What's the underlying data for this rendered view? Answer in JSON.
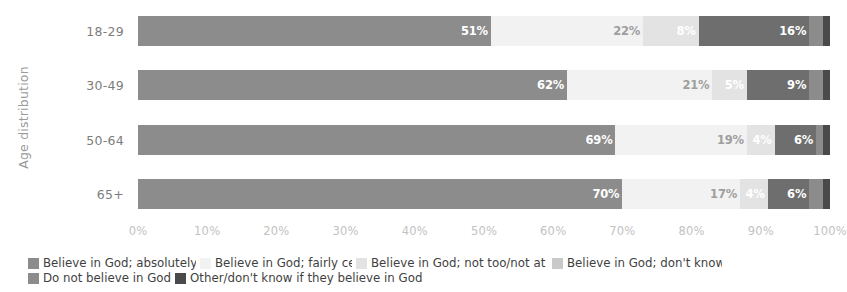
{
  "chart_data": {
    "type": "bar",
    "subtype": "stacked-horizontal-100",
    "title": "",
    "xlabel": "",
    "ylabel": "Age distribution",
    "categories": [
      "18-29",
      "30-49",
      "50-64",
      "65+"
    ],
    "xlim": [
      0,
      100
    ],
    "xticks": [
      "0%",
      "10%",
      "20%",
      "30%",
      "40%",
      "50%",
      "60%",
      "70%",
      "80%",
      "90%",
      "100%"
    ],
    "xtick_values": [
      0,
      10,
      20,
      30,
      40,
      50,
      60,
      70,
      80,
      90,
      100
    ],
    "grid": false,
    "legend_position": "bottom",
    "series": [
      {
        "name": "Believe in God; absolutely certain",
        "color": "#8c8c8c",
        "values": [
          51,
          62,
          69,
          70
        ],
        "labels": [
          "51%",
          "62%",
          "69%",
          "70%"
        ],
        "label_color": "light"
      },
      {
        "name": "Believe in God; fairly certain",
        "color": "#f2f2f2",
        "values": [
          22,
          21,
          19,
          17
        ],
        "labels": [
          "22%",
          "21%",
          "19%",
          "17%"
        ],
        "label_color": "dark"
      },
      {
        "name": "Believe in God; not too/not at all certain",
        "color": "#e3e3e3",
        "values": [
          8,
          5,
          4,
          4
        ],
        "labels": [
          "8%",
          "5%",
          "4%",
          "4%"
        ],
        "label_color": "light"
      },
      {
        "name": "Believe in God; don't know",
        "color": "#6e6e6e",
        "values": [
          16,
          9,
          6,
          6
        ],
        "labels": [
          "16%",
          "9%",
          "6%",
          "6%"
        ],
        "label_color": "light"
      },
      {
        "name": "Do not believe in God",
        "color": "#8c8c8c",
        "values": [
          2,
          2,
          1,
          2
        ],
        "labels": [
          "",
          "",
          "",
          ""
        ],
        "label_color": "light"
      },
      {
        "name": "Other/don't know if they believe in God",
        "color": "#4a4a4a",
        "values": [
          1,
          1,
          1,
          1
        ],
        "labels": [
          "",
          "",
          "",
          ""
        ],
        "label_color": "light"
      }
    ]
  },
  "legend": {
    "items": [
      {
        "label": "Believe in God; absolutely certain",
        "color": "#8c8c8c"
      },
      {
        "label": "Believe in God; fairly certain",
        "color": "#f2f2f2"
      },
      {
        "label": "Believe in God; not too/not at all certain",
        "color": "#e3e3e3"
      },
      {
        "label": "Believe in God; don't know",
        "color": "#c9c9c9"
      },
      {
        "label": "Do not believe in God",
        "color": "#8c8c8c"
      },
      {
        "label": "Other/don't know if they believe in God",
        "color": "#4a4a4a"
      }
    ]
  }
}
